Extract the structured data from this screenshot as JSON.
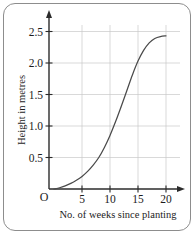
{
  "chart_data": {
    "type": "line",
    "title": "",
    "xlabel": "No. of weeks since planting",
    "ylabel": "Height in metres",
    "xlim": [
      0,
      21.5
    ],
    "ylim": [
      0,
      2.62
    ],
    "grid": true,
    "legend": null,
    "origin_label": "O",
    "x_ticks": [
      5,
      10,
      15,
      20
    ],
    "x_tick_labels": [
      "5",
      "10",
      "15",
      "20"
    ],
    "y_ticks": [
      0.5,
      1.0,
      1.5,
      2.0,
      2.5
    ],
    "y_tick_labels": [
      "0.5",
      "1.0",
      "1.5",
      "2.0",
      "2.5"
    ],
    "series": [
      {
        "name": "plant height",
        "x": [
          0,
          1,
          2,
          3,
          4,
          5,
          6,
          7,
          8,
          9,
          10,
          11,
          12,
          13,
          14,
          15,
          16,
          17,
          18,
          19,
          20
        ],
        "values": [
          0.0,
          0.02,
          0.05,
          0.09,
          0.14,
          0.2,
          0.28,
          0.38,
          0.5,
          0.66,
          0.85,
          1.07,
          1.31,
          1.56,
          1.81,
          2.03,
          2.2,
          2.32,
          2.39,
          2.42,
          2.43
        ]
      }
    ]
  },
  "axis_titles": {
    "x": "No. of weeks since planting",
    "y": "Height in metres"
  },
  "origin": {
    "label": "O"
  },
  "colors": {
    "curve": "#4a4a4a",
    "axis": "#2b2b2b",
    "grid": "#c9c9c9",
    "frame": "#8d8d8d",
    "background": "#ffffff"
  }
}
